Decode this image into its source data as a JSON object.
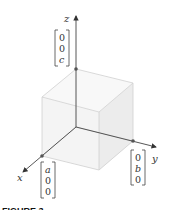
{
  "figure": {
    "axes": {
      "x_label": "x",
      "y_label": "y",
      "z_label": "z"
    },
    "vectors": [
      {
        "name": "a-vector",
        "entries": [
          "a",
          "0",
          "0"
        ]
      },
      {
        "name": "b-vector",
        "entries": [
          "0",
          "b",
          "0"
        ]
      },
      {
        "name": "c-vector",
        "entries": [
          "0",
          "0",
          "c"
        ]
      }
    ],
    "caption": "FIGURE 3"
  }
}
